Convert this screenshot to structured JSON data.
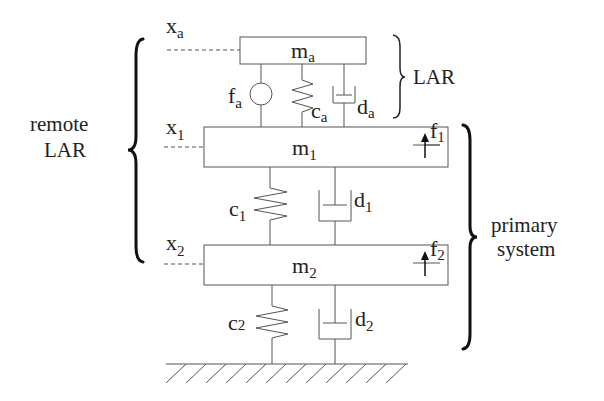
{
  "diagram": {
    "type": "two-degree-of-freedom mass-spring-damper system with local active resonator",
    "masses": {
      "ma": {
        "base": "m",
        "sub": "a"
      },
      "m1": {
        "base": "m",
        "sub": "1"
      },
      "m2": {
        "base": "m",
        "sub": "2"
      }
    },
    "displacements": {
      "xa": {
        "base": "x",
        "sub": "a"
      },
      "x1": {
        "base": "x",
        "sub": "1"
      },
      "x2": {
        "base": "x",
        "sub": "2"
      }
    },
    "springs": {
      "ca": {
        "base": "c",
        "sub": "a"
      },
      "c1": {
        "base": "c",
        "sub": "1"
      },
      "c2": {
        "base": "c",
        "sub": "2"
      }
    },
    "dampers": {
      "da": {
        "base": "d",
        "sub": "a"
      },
      "d1": {
        "base": "d",
        "sub": "1"
      },
      "d2": {
        "base": "d",
        "sub": "2"
      }
    },
    "actuator": {
      "base": "f",
      "sub": "a"
    },
    "forces": {
      "f1": {
        "base": "f",
        "sub": "1"
      },
      "f2": {
        "base": "f",
        "sub": "2"
      }
    },
    "groups": {
      "lar": "LAR",
      "remote_lar_line1": "remote",
      "remote_lar_line2": "LAR",
      "primary_line1": "primary",
      "primary_line2": "system"
    },
    "ground": "fixed ground (hatched)"
  }
}
